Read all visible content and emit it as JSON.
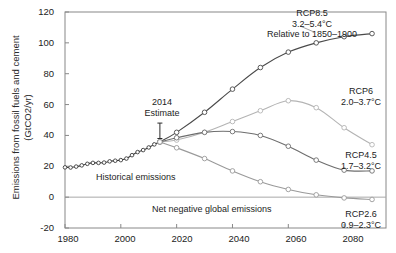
{
  "chart_data": {
    "type": "line",
    "title": "",
    "xlabel": "",
    "ylabel": "Emissions from fossil fuels and cement (GtCO2/yr)",
    "ylabel_line1": "Emissions from fossil fuels and cement",
    "ylabel_line2": "(GtCO2/yr)",
    "xlim": [
      1980,
      2095
    ],
    "ylim": [
      -20,
      120
    ],
    "grid": false,
    "legend_position": "inline-right-annotations",
    "xticks": [
      "1980",
      "2000",
      "2020",
      "2040",
      "2060",
      "2080"
    ],
    "xtick_values": [
      1980,
      2000,
      2020,
      2040,
      2060,
      2080
    ],
    "yticks": [
      "-20",
      "0",
      "20",
      "40",
      "60",
      "80",
      "100",
      "120"
    ],
    "ytick_values": [
      -20,
      0,
      20,
      40,
      60,
      80,
      100,
      120
    ],
    "zero_line": 0,
    "series": [
      {
        "name": "Historical emissions",
        "color": "#3b3b3b",
        "marker": "circle",
        "x": [
          1980,
          1982,
          1984,
          1986,
          1988,
          1990,
          1992,
          1994,
          1996,
          1998,
          2000,
          2002,
          2004,
          2006,
          2008,
          2010,
          2012,
          2014
        ],
        "values": [
          19.3,
          19.2,
          19.8,
          20.6,
          21.6,
          22.2,
          22.2,
          22.4,
          23.2,
          23.6,
          24.0,
          25.0,
          27.2,
          29.2,
          30.5,
          32.2,
          34.2,
          35.8
        ]
      },
      {
        "name": "RCP8.5",
        "color": "#4a4a4a",
        "marker": "circle",
        "x": [
          2014,
          2020,
          2030,
          2040,
          2050,
          2060,
          2070,
          2080,
          2090
        ],
        "values": [
          35.8,
          42.0,
          55.0,
          70.0,
          84.0,
          94.0,
          100.0,
          104.0,
          106.0
        ]
      },
      {
        "name": "RCP6",
        "color": "#b4b4b4",
        "marker": "circle",
        "x": [
          2014,
          2020,
          2030,
          2040,
          2050,
          2060,
          2070,
          2080,
          2090
        ],
        "values": [
          35.8,
          37.0,
          42.0,
          49.0,
          56.0,
          62.5,
          58.0,
          45.0,
          34.0
        ]
      },
      {
        "name": "RCP4.5",
        "color": "#6e6e6e",
        "marker": "circle",
        "x": [
          2014,
          2020,
          2030,
          2040,
          2050,
          2060,
          2070,
          2080,
          2090
        ],
        "values": [
          35.8,
          38.5,
          42.0,
          42.5,
          40.0,
          33.0,
          24.0,
          17.5,
          17.0
        ]
      },
      {
        "name": "RCP2.6",
        "color": "#9a9a9a",
        "marker": "circle",
        "x": [
          2014,
          2020,
          2030,
          2040,
          2050,
          2060,
          2070,
          2080,
          2090
        ],
        "values": [
          35.8,
          32.0,
          25.0,
          17.0,
          10.0,
          5.0,
          1.5,
          -0.5,
          -1.5
        ]
      }
    ],
    "annotations": [
      {
        "id": "estimate-2014",
        "lines": [
          "2014",
          "Estimate"
        ],
        "x": 2012,
        "y": 58,
        "has_pointer": true
      },
      {
        "id": "rcp85-label",
        "lines": [
          "RCP8.5",
          "3.2–5.4°C",
          "Relative to 1850–1900"
        ],
        "x": 2068,
        "y": 113
      },
      {
        "id": "rcp6-label",
        "lines": [
          "RCP6",
          "2.0–3.7°C"
        ],
        "x": 2086,
        "y": 55
      },
      {
        "id": "rcp45-label",
        "lines": [
          "RCP4.5",
          "1.7–3.2°C"
        ],
        "x": 2086,
        "y": 23
      },
      {
        "id": "rcp26-label",
        "lines": [
          "RCP2.6",
          "0.9–2.3°C"
        ],
        "x": 2086,
        "y": -8
      },
      {
        "id": "historical-label",
        "lines": [
          "Historical emissions"
        ],
        "x": 2014,
        "y": 12
      },
      {
        "id": "net-negative-label",
        "lines": [
          "Net negative global emissions"
        ],
        "x": 2044,
        "y": -9
      }
    ]
  },
  "labels": {
    "ylabel_line1": "Emissions from fossil fuels and cement",
    "ylabel_line2": "(GtCO2/yr)",
    "ytick_120": "120",
    "ytick_100": "100",
    "ytick_80": "80",
    "ytick_60": "60",
    "ytick_40": "40",
    "ytick_20": "20",
    "ytick_0": "0",
    "ytick_m20": "-20",
    "xtick_1980": "1980",
    "xtick_2000": "2000",
    "xtick_2020": "2020",
    "xtick_2040": "2040",
    "xtick_2060": "2060",
    "xtick_2080": "2080",
    "estimate_year": "2014",
    "estimate_word": "Estimate",
    "rcp85_name": "RCP8.5",
    "rcp85_range": "3.2–5.4°C",
    "rcp85_baseline": "Relative to 1850–1900",
    "rcp6_name": "RCP6",
    "rcp6_range": "2.0–3.7°C",
    "rcp45_name": "RCP4.5",
    "rcp45_range": "1.7–3.2°C",
    "rcp26_name": "RCP2.6",
    "rcp26_range": "0.9–2.3°C",
    "historical": "Historical emissions",
    "net_negative": "Net negative global emissions"
  },
  "colors": {
    "historical": "#3b3b3b",
    "rcp85": "#4a4a4a",
    "rcp6": "#b4b4b4",
    "rcp45": "#6e6e6e",
    "rcp26": "#9a9a9a",
    "axis": "#888888",
    "zero_line": "#a8a8a8",
    "text": "#1c1c1c",
    "background": "#ffffff"
  }
}
